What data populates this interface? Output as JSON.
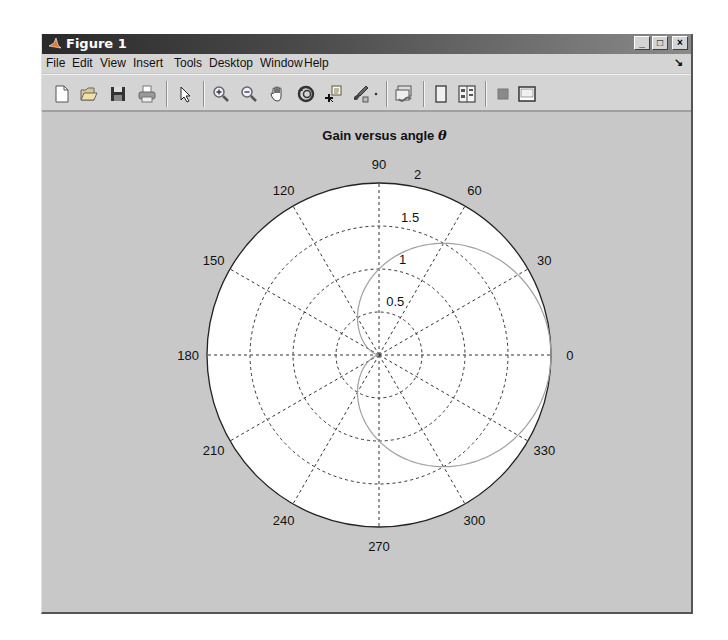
{
  "window": {
    "title": "Figure 1",
    "buttons": {
      "minimize": "_",
      "maximize": "□",
      "close": "×"
    }
  },
  "menubar": {
    "items": [
      "File",
      "Edit",
      "View",
      "Insert",
      "Tools",
      "Desktop",
      "Window",
      "Help"
    ],
    "dock_arrow": "↘"
  },
  "toolbar": {
    "items": [
      "new-figure-icon",
      "open-file-icon",
      "save-icon",
      "print-icon",
      "edit-plot-arrow-icon",
      "zoom-in-icon",
      "zoom-out-icon",
      "pan-hand-icon",
      "rotate-3d-icon",
      "data-cursor-icon",
      "brush-icon",
      "brush-dropdown-icon",
      "link-plot-icon",
      "hide-plot-tools-icon",
      "show-plot-tools-icon",
      "insert-colorbar-icon",
      "insert-legend-icon"
    ]
  },
  "chart_title": {
    "text": "Gain versus angle ",
    "symbol": "θ"
  },
  "chart_data": {
    "type": "line",
    "subtype": "polar",
    "title": "Gain versus angle θ",
    "xlabel": "",
    "ylabel": "",
    "theta_ticks_deg": [
      0,
      30,
      60,
      90,
      120,
      150,
      180,
      210,
      240,
      270,
      300,
      330
    ],
    "r_ticks": [
      0.5,
      1,
      1.5,
      2
    ],
    "r_lim": [
      0,
      2
    ],
    "grid": true,
    "grid_style": "dashed",
    "legend": null,
    "series": [
      {
        "name": "gain",
        "equation": "r = 1 + cos(theta)",
        "color": "#a0a0a0",
        "theta_deg": [
          0,
          30,
          60,
          90,
          120,
          150,
          180,
          210,
          240,
          270,
          300,
          330,
          360
        ],
        "r": [
          2.0,
          1.866,
          1.5,
          1.0,
          0.5,
          0.134,
          0.0,
          0.134,
          0.5,
          1.0,
          1.5,
          1.866,
          2.0
        ]
      }
    ]
  },
  "axis_labels": {
    "angles": [
      "0",
      "30",
      "60",
      "90",
      "120",
      "150",
      "180",
      "210",
      "240",
      "270",
      "300",
      "330"
    ],
    "radii": [
      "0.5",
      "1",
      "1.5",
      "2"
    ]
  }
}
